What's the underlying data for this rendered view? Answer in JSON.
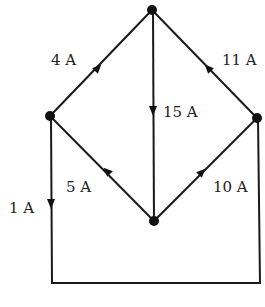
{
  "diagram": {
    "type": "circuit-current-network",
    "colors": {
      "line": "#1a1a1a",
      "node": "#111111",
      "text": "#222222",
      "background": "#ffffff"
    },
    "nodes": [
      {
        "id": "top",
        "x": 152,
        "y": 10
      },
      {
        "id": "left",
        "x": 50,
        "y": 116
      },
      {
        "id": "right",
        "x": 257,
        "y": 118
      },
      {
        "id": "bottom",
        "x": 154,
        "y": 221
      }
    ],
    "edges": [
      {
        "id": "left-top",
        "from": "left",
        "to": "top",
        "current": "4 A",
        "direction": "left-to-top"
      },
      {
        "id": "top-bottom",
        "from": "top",
        "to": "bottom",
        "current": "15 A",
        "direction": "top-to-bottom"
      },
      {
        "id": "right-top",
        "from": "right",
        "to": "top",
        "current": "11 A",
        "direction": "right-to-top"
      },
      {
        "id": "bottom-left",
        "from": "bottom",
        "to": "left",
        "current": "5 A",
        "direction": "bottom-to-left"
      },
      {
        "id": "bottom-right",
        "from": "bottom",
        "to": "right",
        "current": "10 A",
        "direction": "bottom-to-right"
      },
      {
        "id": "left-loop-right",
        "from": "left",
        "to": "right",
        "current": "1 A",
        "direction": "down-left-side-across-bottom-up-right"
      }
    ],
    "labels": {
      "left_top": "4 A",
      "top_bottom": "15 A",
      "right_top": "11 A",
      "bottom_left": "5 A",
      "bottom_right": "10 A",
      "outer_loop": "1 A"
    }
  }
}
